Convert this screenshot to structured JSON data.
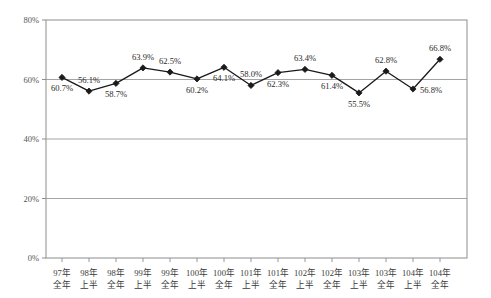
{
  "chart_data": {
    "type": "line",
    "title": "",
    "subtitle": "",
    "xlabel": "",
    "ylabel": "",
    "ylim": [
      0,
      80
    ],
    "yticks": [
      "0%",
      "20%",
      "40%",
      "60%",
      "80%"
    ],
    "ytick_values": [
      0,
      20,
      40,
      60,
      80
    ],
    "grid": true,
    "legend": "none",
    "marker": "diamond",
    "line_color": "#1a1a1a",
    "marker_color": "#1a1a1a",
    "grid_color": "#9a9a9a",
    "frame_color": "#8d8d8d",
    "categories": [
      "97年\n全年",
      "98年\n上半",
      "98年\n全年",
      "99年\n上半",
      "99年\n全年",
      "100年\n上半",
      "100年\n全年",
      "101年\n上半",
      "101年\n全年",
      "102年\n上半",
      "102年\n全年",
      "103年\n上半",
      "103年\n全年",
      "104年\n上半",
      "104年\n全年"
    ],
    "category_top": [
      "97年",
      "98年",
      "98年",
      "99年",
      "99年",
      "100年",
      "100年",
      "101年",
      "101年",
      "102年",
      "102年",
      "103年",
      "103年",
      "104年",
      "104年"
    ],
    "category_bottom": [
      "全年",
      "上半",
      "全年",
      "上半",
      "全年",
      "上半",
      "全年",
      "上半",
      "全年",
      "上半",
      "全年",
      "上半",
      "全年",
      "上半",
      "全年"
    ],
    "values": [
      60.7,
      56.1,
      58.7,
      63.9,
      62.5,
      60.2,
      64.1,
      58.0,
      62.3,
      63.4,
      61.4,
      55.5,
      62.8,
      56.8,
      66.8
    ],
    "data_labels": [
      "60.7%",
      "56.1%",
      "58.7%",
      "63.9%",
      "62.5%",
      "60.2%",
      "64.1%",
      "58.0%",
      "62.3%",
      "63.4%",
      "61.4%",
      "55.5%",
      "62.8%",
      "56.8%",
      "66.8%"
    ],
    "label_positions": [
      "below",
      "above",
      "below",
      "above",
      "above",
      "below",
      "below",
      "above",
      "below",
      "above",
      "below",
      "below",
      "above",
      "right",
      "above"
    ]
  }
}
